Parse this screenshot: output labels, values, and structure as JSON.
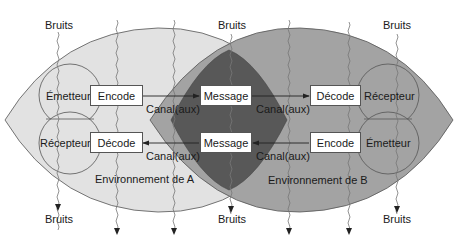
{
  "diagram": {
    "type": "communication-model",
    "colors": {
      "environment_a": "#e2e2e2",
      "environment_b": "#a3a3a3",
      "overlap": "#585858",
      "stroke": "#555555",
      "box_fill": "#ffffff"
    },
    "noise_label": "Bruits",
    "noise_top_labels": [
      "Bruits",
      "Bruits",
      "Bruits"
    ],
    "noise_bottom_labels": [
      "Bruits",
      "Bruits",
      "Bruits"
    ],
    "environment_a": {
      "label": "Environnement de A",
      "sender": "Émetteur",
      "receiver": "Récepteur",
      "encode": "Encode",
      "decode": "Décode"
    },
    "environment_b": {
      "label": "Environnement de B",
      "sender": "Émetteur",
      "receiver": "Récepteur",
      "encode": "Encode",
      "decode": "Décode"
    },
    "shared": {
      "message_top": "Message",
      "message_bottom": "Message"
    },
    "channels": {
      "a_to_msg_top": "Canal(aux)",
      "msg_top_to_b": "Canal(aux)",
      "msg_bottom_to_a": "Canal(aux)",
      "b_to_msg_bottom": "Canal(aux)"
    }
  }
}
